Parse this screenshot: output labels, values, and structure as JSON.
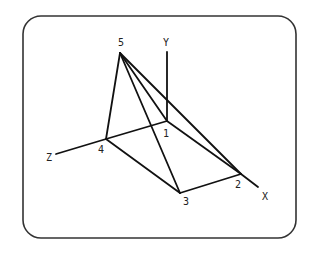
{
  "diagram": {
    "title": "",
    "frame": {
      "x": 23,
      "y": 16,
      "width": 273,
      "height": 222,
      "radius": 18,
      "stroke": "#333333"
    },
    "line_color": "#111111",
    "vertices": [
      {
        "id": "1",
        "label": "1",
        "x": 167,
        "y": 121,
        "lx": 166,
        "ly": 137
      },
      {
        "id": "2",
        "label": "2",
        "x": 241,
        "y": 174,
        "lx": 238,
        "ly": 188
      },
      {
        "id": "3",
        "label": "3",
        "x": 180,
        "y": 193,
        "lx": 186,
        "ly": 205
      },
      {
        "id": "4",
        "label": "4",
        "x": 106,
        "y": 139,
        "lx": 101,
        "ly": 153
      },
      {
        "id": "5",
        "label": "5",
        "x": 120,
        "y": 53,
        "lx": 121,
        "ly": 46
      }
    ],
    "edges": [
      [
        "5",
        "1"
      ],
      [
        "5",
        "2"
      ],
      [
        "5",
        "3"
      ],
      [
        "5",
        "4"
      ],
      [
        "1",
        "2"
      ],
      [
        "1",
        "4"
      ],
      [
        "4",
        "3"
      ],
      [
        "3",
        "2"
      ]
    ],
    "axes": [
      {
        "name": "Y",
        "label": "Y",
        "from": [
          167,
          121
        ],
        "to": [
          167,
          52
        ],
        "lx": 166,
        "ly": 46
      },
      {
        "name": "Z",
        "label": "Z",
        "from": [
          106,
          139
        ],
        "to": [
          56,
          154
        ],
        "lx": 49,
        "ly": 161
      },
      {
        "name": "X",
        "label": "X",
        "from": [
          241,
          174
        ],
        "to": [
          258,
          187
        ],
        "lx": 265,
        "ly": 200
      }
    ]
  }
}
